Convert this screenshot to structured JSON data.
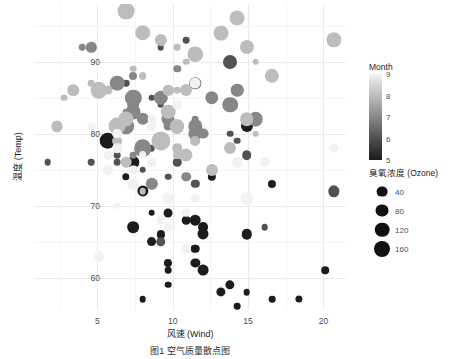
{
  "chart_data": {
    "type": "scatter",
    "title": "",
    "xlabel": "风速 (Wind)",
    "ylabel": "温度 (Temp)",
    "caption": "图1 空气质量散点图",
    "xlim": [
      0.8,
      21.5
    ],
    "ylim": [
      55.5,
      98
    ],
    "xticks": [
      5,
      10,
      15,
      20
    ],
    "yticks": [
      60,
      70,
      80,
      90
    ],
    "grid": true,
    "legend_position": "right",
    "colour_legend": {
      "title": "Month",
      "ticks": [
        9,
        8,
        7,
        6,
        5
      ],
      "low_colour": "#1c1c1c",
      "high_colour": "#f2f2f2",
      "domain": [
        5,
        9
      ]
    },
    "size_legend": {
      "title": "臭氧浓度 (Ozone)",
      "breaks": [
        40,
        80,
        120,
        160
      ],
      "colour": "#111111"
    },
    "series": [
      {
        "name": "airquality",
        "fields": [
          "wind",
          "temp",
          "ozone",
          "month"
        ],
        "points": [
          [
            7.4,
            67,
            41,
            5
          ],
          [
            8.0,
            72,
            36,
            5
          ],
          [
            12.6,
            74,
            12,
            5
          ],
          [
            11.5,
            62,
            18,
            5
          ],
          [
            14.3,
            56,
            0,
            5
          ],
          [
            14.9,
            66,
            28,
            5
          ],
          [
            8.6,
            65,
            23,
            5
          ],
          [
            13.8,
            59,
            19,
            5
          ],
          [
            20.1,
            61,
            8,
            5
          ],
          [
            8.6,
            69,
            0,
            5
          ],
          [
            6.9,
            74,
            7,
            5
          ],
          [
            9.7,
            69,
            16,
            5
          ],
          [
            9.2,
            66,
            11,
            5
          ],
          [
            10.9,
            68,
            14,
            5
          ],
          [
            13.2,
            58,
            18,
            5
          ],
          [
            11.5,
            64,
            14,
            5
          ],
          [
            12.0,
            66,
            34,
            5
          ],
          [
            18.4,
            57,
            6,
            5
          ],
          [
            11.5,
            68,
            30,
            5
          ],
          [
            9.7,
            62,
            11,
            5
          ],
          [
            9.7,
            59,
            1,
            5
          ],
          [
            16.6,
            73,
            11,
            5
          ],
          [
            9.7,
            61,
            4,
            5
          ],
          [
            12.0,
            61,
            32,
            5
          ],
          [
            16.6,
            57,
            0,
            5
          ],
          [
            14.9,
            58,
            0,
            5
          ],
          [
            8.0,
            57,
            0,
            5
          ],
          [
            12.0,
            67,
            23,
            5
          ],
          [
            14.9,
            81,
            45,
            5
          ],
          [
            5.7,
            79,
            115,
            5
          ],
          [
            7.4,
            76,
            37,
            5
          ],
          [
            8.6,
            78,
            0,
            6
          ],
          [
            9.7,
            74,
            0,
            6
          ],
          [
            16.1,
            67,
            0,
            6
          ],
          [
            9.2,
            84,
            0,
            6
          ],
          [
            8.6,
            85,
            0,
            6
          ],
          [
            14.3,
            79,
            0,
            6
          ],
          [
            9.7,
            82,
            29,
            6
          ],
          [
            6.9,
            87,
            0,
            6
          ],
          [
            13.8,
            90,
            71,
            6
          ],
          [
            11.5,
            87,
            39,
            6
          ],
          [
            10.9,
            93,
            0,
            6
          ],
          [
            9.2,
            92,
            0,
            6
          ],
          [
            8.0,
            82,
            23,
            6
          ],
          [
            13.8,
            80,
            0,
            6
          ],
          [
            11.5,
            79,
            0,
            6
          ],
          [
            14.9,
            77,
            21,
            6
          ],
          [
            20.7,
            72,
            37,
            6
          ],
          [
            9.2,
            65,
            20,
            6
          ],
          [
            11.5,
            73,
            12,
            6
          ],
          [
            10.3,
            76,
            13,
            6
          ],
          [
            6.3,
            77,
            0,
            6
          ],
          [
            1.7,
            76,
            0,
            6
          ],
          [
            4.6,
            76,
            0,
            6
          ],
          [
            6.3,
            76,
            0,
            6
          ],
          [
            8.0,
            75,
            0,
            6
          ],
          [
            8.0,
            78,
            135,
            7
          ],
          [
            8.6,
            73,
            49,
            7
          ],
          [
            12.0,
            80,
            32,
            7
          ],
          [
            7.4,
            77,
            0,
            7
          ],
          [
            7.4,
            83,
            64,
            7
          ],
          [
            7.4,
            84,
            40,
            7
          ],
          [
            9.2,
            85,
            77,
            7
          ],
          [
            6.9,
            81,
            97,
            7
          ],
          [
            13.8,
            84,
            97,
            7
          ],
          [
            7.4,
            83,
            85,
            7
          ],
          [
            6.9,
            83,
            0,
            7
          ],
          [
            7.4,
            88,
            10,
            7
          ],
          [
            4.6,
            92,
            27,
            7
          ],
          [
            4.0,
            92,
            0,
            7
          ],
          [
            10.3,
            89,
            7,
            7
          ],
          [
            8.0,
            82,
            48,
            7
          ],
          [
            8.6,
            73,
            35,
            7
          ],
          [
            11.5,
            81,
            61,
            7
          ],
          [
            11.5,
            91,
            79,
            7
          ],
          [
            11.5,
            80,
            63,
            7
          ],
          [
            9.7,
            81,
            16,
            7
          ],
          [
            11.5,
            82,
            0,
            7
          ],
          [
            10.3,
            84,
            0,
            7
          ],
          [
            6.3,
            87,
            80,
            7
          ],
          [
            7.4,
            85,
            108,
            7
          ],
          [
            10.9,
            74,
            20,
            7
          ],
          [
            10.3,
            81,
            52,
            7
          ],
          [
            15.5,
            82,
            82,
            7
          ],
          [
            14.3,
            86,
            50,
            7
          ],
          [
            12.6,
            85,
            64,
            7
          ],
          [
            9.7,
            82,
            59,
            7
          ],
          [
            3.4,
            86,
            39,
            8
          ],
          [
            8.0,
            88,
            9,
            8
          ],
          [
            5.7,
            86,
            16,
            8
          ],
          [
            9.7,
            83,
            78,
            8
          ],
          [
            2.3,
            81,
            35,
            8
          ],
          [
            6.3,
            81,
            66,
            8
          ],
          [
            6.3,
            81,
            122,
            8
          ],
          [
            6.9,
            82,
            89,
            8
          ],
          [
            5.1,
            86,
            110,
            8
          ],
          [
            2.8,
            85,
            0,
            8
          ],
          [
            4.6,
            87,
            0,
            8
          ],
          [
            7.4,
            89,
            0,
            8
          ],
          [
            15.5,
            90,
            0,
            8
          ],
          [
            10.9,
            90,
            0,
            8
          ],
          [
            10.3,
            92,
            0,
            8
          ],
          [
            10.9,
            86,
            44,
            8
          ],
          [
            9.7,
            86,
            28,
            8
          ],
          [
            14.9,
            82,
            65,
            8
          ],
          [
            15.5,
            80,
            0,
            8
          ],
          [
            6.3,
            79,
            22,
            8
          ],
          [
            10.9,
            77,
            59,
            8
          ],
          [
            11.5,
            79,
            23,
            8
          ],
          [
            6.9,
            76,
            31,
            8
          ],
          [
            13.8,
            78,
            44,
            8
          ],
          [
            10.3,
            78,
            21,
            8
          ],
          [
            10.3,
            77,
            9,
            8
          ],
          [
            8.0,
            72,
            0,
            8
          ],
          [
            12.6,
            75,
            45,
            8
          ],
          [
            9.2,
            79,
            168,
            8
          ],
          [
            10.3,
            81,
            73,
            8
          ],
          [
            10.3,
            86,
            0,
            8
          ],
          [
            16.6,
            88,
            76,
            8
          ],
          [
            6.9,
            97,
            118,
            8
          ],
          [
            13.2,
            94,
            84,
            8
          ],
          [
            14.3,
            96,
            85,
            8
          ],
          [
            8.0,
            94,
            96,
            8
          ],
          [
            11.5,
            91,
            78,
            8
          ],
          [
            14.9,
            92,
            73,
            8
          ],
          [
            20.7,
            93,
            91,
            8
          ],
          [
            9.2,
            93,
            47,
            8
          ],
          [
            11.5,
            87,
            32,
            9
          ],
          [
            10.3,
            84,
            20,
            9
          ],
          [
            6.3,
            80,
            23,
            9
          ],
          [
            6.3,
            78,
            21,
            9
          ],
          [
            5.7,
            75,
            24,
            9
          ],
          [
            7.4,
            73,
            44,
            9
          ],
          [
            8.6,
            81,
            21,
            9
          ],
          [
            14.3,
            76,
            28,
            9
          ],
          [
            8.0,
            77,
            9,
            9
          ],
          [
            11.5,
            71,
            13,
            9
          ],
          [
            14.9,
            71,
            46,
            9
          ],
          [
            20.7,
            78,
            18,
            9
          ],
          [
            9.7,
            67,
            13,
            9
          ],
          [
            16.1,
            76,
            24,
            9
          ],
          [
            9.2,
            68,
            16,
            9
          ],
          [
            8.6,
            82,
            13,
            9
          ],
          [
            10.9,
            64,
            23,
            9
          ],
          [
            9.7,
            71,
            36,
            9
          ],
          [
            4.6,
            81,
            7,
            9
          ],
          [
            10.9,
            69,
            14,
            9
          ],
          [
            5.1,
            63,
            30,
            9
          ],
          [
            6.3,
            70,
            0,
            9
          ],
          [
            5.7,
            77,
            14,
            9
          ],
          [
            7.4,
            75,
            18,
            9
          ],
          [
            8.6,
            76,
            20,
            9
          ]
        ]
      }
    ]
  }
}
